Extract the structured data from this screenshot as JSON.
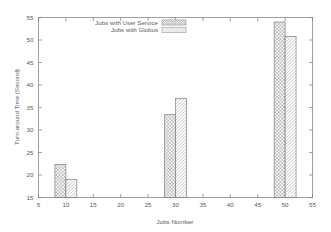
{
  "chart_data": {
    "type": "bar",
    "title": "",
    "xlabel": "Jobs Number",
    "ylabel": "Turn-around Time (Second)",
    "xlim": [
      5,
      55
    ],
    "ylim": [
      15,
      55
    ],
    "xticks": [
      5,
      10,
      15,
      20,
      25,
      30,
      35,
      40,
      45,
      50,
      55
    ],
    "xtick_labels": [
      "5",
      "10",
      "15",
      "20",
      "25",
      "30",
      "35",
      "40",
      "45",
      "50",
      "55"
    ],
    "yticks": [
      15,
      20,
      25,
      30,
      35,
      40,
      45,
      50,
      55
    ],
    "ytick_labels": [
      "15",
      "20",
      "25",
      "30",
      "35",
      "40",
      "45",
      "50",
      "55"
    ],
    "grid": false,
    "legend_position": "top-left-inside",
    "categories": [
      10,
      30,
      50
    ],
    "bar_width": 2,
    "series": [
      {
        "name": "Jobs with User Service",
        "pattern": "crosshatch",
        "values": [
          22.3,
          33.4,
          54.0
        ]
      },
      {
        "name": "Jobs with Globus",
        "pattern": "diagonal",
        "values": [
          19.0,
          37.0,
          50.8
        ]
      }
    ]
  },
  "legend": {
    "entries": [
      {
        "label": "Jobs with User Service",
        "pattern": "crosshatch"
      },
      {
        "label": "Jobs with Globus",
        "pattern": "diagonal"
      }
    ]
  },
  "axes": {
    "x_title": "Jobs Number",
    "y_title": "Turn-around Time (Second)"
  }
}
